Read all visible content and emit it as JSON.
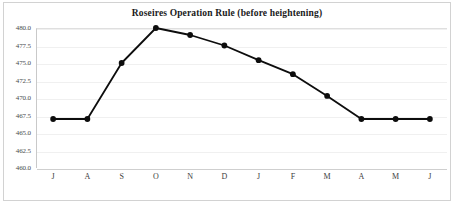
{
  "chart_data": {
    "type": "line",
    "title": "Roseires Operation Rule (before heightening)",
    "xlabel": "",
    "ylabel": "",
    "categories": [
      "J",
      "A",
      "S",
      "O",
      "N",
      "D",
      "J",
      "F",
      "M",
      "A",
      "M",
      "J"
    ],
    "values": [
      467.0,
      467.0,
      475.0,
      480.0,
      479.0,
      477.5,
      475.4,
      473.4,
      470.3,
      467.0,
      467.0,
      467.0
    ],
    "series": [
      {
        "name": "Operation Rule Level",
        "values": [
          467.0,
          467.0,
          475.0,
          480.0,
          479.0,
          477.5,
          475.4,
          473.4,
          470.3,
          467.0,
          467.0,
          467.0
        ]
      }
    ],
    "ylim": [
      460.0,
      480.0
    ],
    "y_ticks": [
      480.0,
      477.5,
      475.0,
      472.5,
      470.0,
      467.5,
      465.0,
      462.5,
      460.0
    ],
    "y_tick_labels": [
      "480.0",
      "477.5",
      "475.0",
      "472.5",
      "470.0",
      "467.5",
      "465.0",
      "462.5",
      "460.0"
    ],
    "x_tick_labels": [
      "J",
      "A",
      "S",
      "O",
      "N",
      "D",
      "J",
      "F",
      "M",
      "A",
      "M",
      "J"
    ],
    "grid": true,
    "legend": false,
    "legend_position": "none",
    "marker": "circle",
    "line_color": "#0d0d0d",
    "marker_color": "#0d0d0d",
    "grid_color": "#f0f0f0",
    "background_color": "#ffffff",
    "frame_color": "#d2d2d2"
  }
}
